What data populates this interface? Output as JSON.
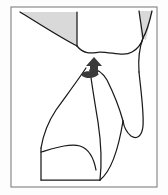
{
  "figure": {
    "width": 168,
    "height": 195,
    "background_color": "#fdfdfd",
    "frame": {
      "name": "outer-frame",
      "x": 11,
      "y": 7,
      "width": 146,
      "height": 180,
      "stroke_color": "#8a8a8a",
      "stroke_width": 1.2,
      "fill_color": "#ffffff"
    },
    "palette": {
      "contour_stroke": "#1a1a1a",
      "shaded_fill": "#d9d9d9",
      "shaded_stroke": "#1a1a1a",
      "marker_fill": "#3a3a3a",
      "frame_stroke": "#8a8a8a",
      "canvas": "#ffffff"
    },
    "shaded_regions": [
      {
        "name": "upper-left-shaded-wedge",
        "label": "Upper left shaded wedge",
        "fill": "#d9d9d9",
        "path": "M 20 12 L 77 12 L 77 46 C 62 40 44 27 20 12 Z"
      },
      {
        "name": "upper-right-shaded-sliver",
        "label": "Upper right shaded sliver",
        "fill": "#d9d9d9",
        "path": "M 139 11 L 152 11 L 146 40 L 141 37 Z"
      }
    ],
    "contours": [
      {
        "name": "contour-upper-left-sweep",
        "label": "Upper left sweeping boundary",
        "path": "M 20 12 C 44 27 63 39 77 46"
      },
      {
        "name": "contour-wedge-right-edge",
        "label": "Right edge of upper left wedge",
        "path": "M 77 12 L 77 46"
      },
      {
        "name": "contour-central-valley",
        "label": "Central descending valley curve",
        "path": "M 77 46 C 84 55 92 53 100 52 C 112 52 124 57 132 52 C 139 48 142 42 143 38"
      },
      {
        "name": "contour-right-upper-stroke",
        "label": "Upper right descending stroke",
        "path": "M 139 11 L 143 38"
      },
      {
        "name": "contour-right-crossing-stroke",
        "label": "Right crossing stroke to lower right",
        "path": "M 152 11 C 149 24 146 33 143 38 C 140 46 138 58 139 72"
      },
      {
        "name": "contour-right-limb-outer",
        "label": "Right outer limb boundary",
        "path": "M 139 72 C 141 92 144 112 143 126 C 142 136 137 140 131 136 C 126 132 124 127 123 121"
      },
      {
        "name": "contour-right-limb-inner",
        "label": "Right inner limb boundary",
        "path": "M 123 121 C 120 110 114 94 107 80 C 102 72 96 68 90 70"
      },
      {
        "name": "contour-left-long-sweep",
        "label": "Long left descending sweep",
        "path": "M 86 68 C 78 80 66 96 56 110 C 48 122 43 136 41 148"
      },
      {
        "name": "contour-left-lower-edge",
        "label": "Lower left vertical edge",
        "path": "M 41 148 L 41 180"
      },
      {
        "name": "contour-lower-arch",
        "label": "Lower interior arch",
        "path": "M 41 152 C 55 148 70 143 80 146 C 89 149 94 159 96 170"
      },
      {
        "name": "contour-lower-center-stroke",
        "label": "Lower center descending stroke",
        "path": "M 90 70 C 92 86 95 104 98 122 C 101 142 102 162 100 180"
      },
      {
        "name": "contour-bottom-baseline",
        "label": "Bottom baseline",
        "path": "M 41 180 L 100 180"
      },
      {
        "name": "contour-bottom-right-tail",
        "label": "Bottom right tail toward frame",
        "path": "M 100 180 C 110 172 118 152 123 121"
      }
    ],
    "markers": [
      {
        "name": "arrow-marker-up",
        "label": "Upward pointing arrow marker",
        "direction": "up",
        "fill": "#3a3a3a",
        "x": 86,
        "y": 57,
        "width": 16,
        "height": 18,
        "path": "M 94 57 L 102 66 L 98 66 L 98 75 L 90 75 L 90 66 L 86 66 Z"
      },
      {
        "name": "marker-base-smudge",
        "label": "Dark smudge at arrow base",
        "fill": "#3a3a3a",
        "path": "M 82 73 C 86 70 94 71 99 74 C 95 79 86 79 82 76 Z"
      }
    ]
  }
}
